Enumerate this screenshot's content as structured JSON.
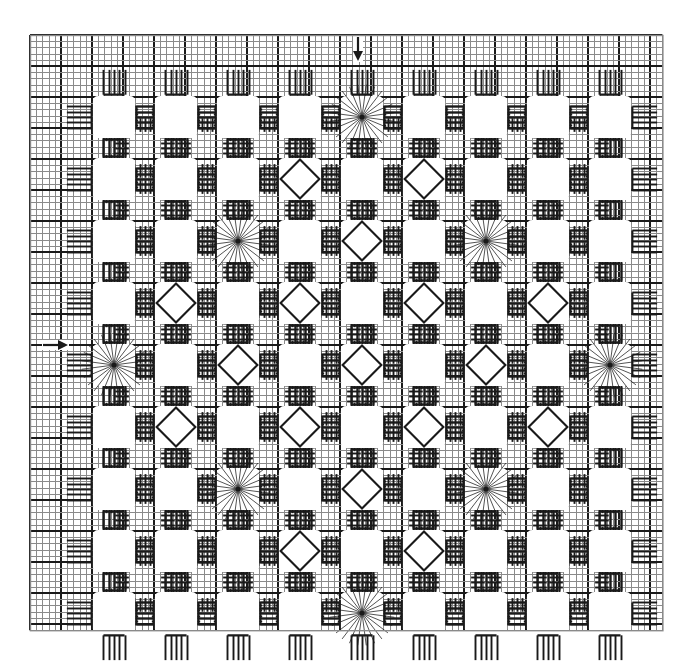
{
  "document": {
    "title": "Hardanger Embroidery Chart",
    "background_color": "#ffffff",
    "ink_color": "#1a1a1a",
    "grid_light_color": "#8a8a8a",
    "grid_heavy_color": "#1a1a1a",
    "width": 692,
    "height": 662
  },
  "chart_data": {
    "type": "table",
    "grid": {
      "cell_size_px": 6.2,
      "heavy_line_every": 5,
      "columns": 102,
      "rows": 96,
      "origin_x_px": 30,
      "origin_y_px": 35,
      "light_line_width_px": 1,
      "heavy_line_width_px": 2
    },
    "motif_grid": {
      "rows": 9,
      "columns": 9,
      "repeat_px": 62,
      "first_center_x_px": 114,
      "first_center_y_px": 117,
      "legend": {
        "o": "plain cut opening (no filling stitch)",
        "d": "dove's eye diamond filling",
        "s": "spider web star / woven wheel filling"
      },
      "cells": [
        [
          "o",
          "o",
          "o",
          "o",
          "s",
          "o",
          "o",
          "o",
          "o"
        ],
        [
          "o",
          "o",
          "o",
          "d",
          "o",
          "d",
          "o",
          "o",
          "o"
        ],
        [
          "o",
          "o",
          "s",
          "o",
          "d",
          "o",
          "s",
          "o",
          "o"
        ],
        [
          "o",
          "d",
          "o",
          "d",
          "o",
          "d",
          "o",
          "d",
          "o"
        ],
        [
          "s",
          "o",
          "d",
          "o",
          "d",
          "o",
          "d",
          "o",
          "s"
        ],
        [
          "o",
          "d",
          "o",
          "d",
          "o",
          "d",
          "o",
          "d",
          "o"
        ],
        [
          "o",
          "o",
          "s",
          "o",
          "d",
          "o",
          "s",
          "o",
          "o"
        ],
        [
          "o",
          "o",
          "o",
          "d",
          "o",
          "d",
          "o",
          "o",
          "o"
        ],
        [
          "o",
          "o",
          "o",
          "o",
          "s",
          "o",
          "o",
          "o",
          "o"
        ]
      ]
    },
    "markers": [
      {
        "name": "top-center-arrow",
        "icon": "arrow-down",
        "x_px": 358,
        "y_px": 48,
        "meaning": "vertical centre of design"
      },
      {
        "name": "left-center-arrow",
        "icon": "arrow-right",
        "x_px": 55,
        "y_px": 345,
        "meaning": "horizontal centre of design"
      }
    ],
    "counts": {
      "openings_total": 81,
      "diamonds": 24,
      "stars": 10,
      "plain_openings": 47
    }
  }
}
